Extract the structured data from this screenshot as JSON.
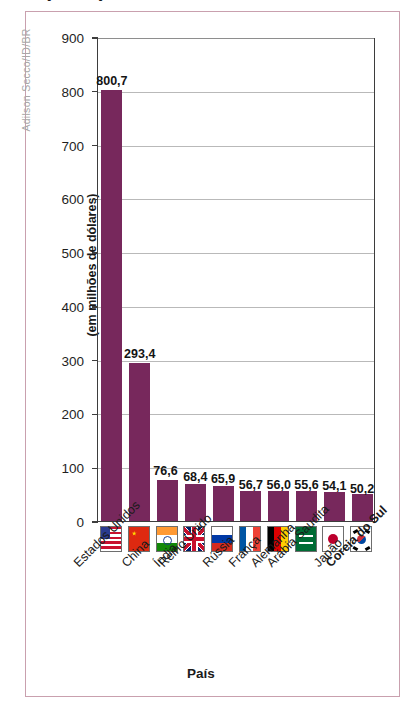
{
  "figure": {
    "title": "(2021)",
    "credit": "Adilson Secco/ID/BR",
    "frame_color": "#c9a0ae"
  },
  "chart_data": {
    "type": "bar",
    "title": "(2021)",
    "xlabel": "País",
    "ylabel": "(em milhões de dólares)",
    "ylim": [
      0,
      900
    ],
    "ytick_step": 100,
    "yticks": [
      "0",
      "100",
      "200",
      "300",
      "400",
      "500",
      "600",
      "700",
      "800",
      "900"
    ],
    "grid": true,
    "legend": "none",
    "bar_color": "#77285c",
    "categories": [
      "Estados Unidos",
      "China",
      "Índia",
      "Reino Unido",
      "Rússia",
      "França",
      "Alemanha",
      "Arábia Saudita",
      "Japão",
      "Coreia do Sul"
    ],
    "values": [
      800.7,
      293.4,
      76.6,
      68.4,
      65.9,
      56.7,
      56.0,
      55.6,
      54.1,
      50.2
    ],
    "value_labels": [
      "800,7",
      "293,4",
      "76,6",
      "68,4",
      "65,9",
      "56,7",
      "56,0",
      "55,6",
      "54,1",
      "50,2"
    ],
    "highlighted_category": "Coreia do Sul",
    "flags": [
      "flag-estados-unidos-icon",
      "flag-china-icon",
      "flag-india-icon",
      "flag-reino-unido-icon",
      "flag-russia-icon",
      "flag-franca-icon",
      "flag-alemanha-icon",
      "flag-arabia-saudita-icon",
      "flag-japao-icon",
      "flag-coreia-do-sul-icon"
    ]
  }
}
